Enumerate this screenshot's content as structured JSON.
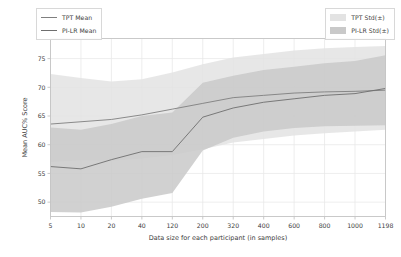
{
  "chart_data": {
    "type": "line",
    "title": "",
    "xlabel": "Data size for each participant (in samples)",
    "ylabel": "Mean AUC% Score",
    "x_tick_labels": [
      "5",
      "10",
      "20",
      "40",
      "120",
      "200",
      "320",
      "400",
      "600",
      "800",
      "1000",
      "1198"
    ],
    "x_positions": [
      0,
      1,
      2,
      3,
      4,
      5,
      6,
      7,
      8,
      9,
      10,
      11
    ],
    "y_tick_labels": [
      "50",
      "55",
      "60",
      "65",
      "70",
      "75"
    ],
    "ylim": [
      47.5,
      78.5
    ],
    "grid": true,
    "legend_position": "top-left and top-right (outside axes, overlapping)",
    "series": [
      {
        "name": "TPT Mean",
        "type": "line",
        "color": "#7f7f7f",
        "values": [
          63.6,
          64.0,
          64.4,
          65.2,
          66.2,
          67.2,
          68.2,
          68.6,
          69.0,
          69.2,
          69.3,
          69.5
        ],
        "band_name": "TPT Std(±)",
        "band_color": "#e3e3e3",
        "band_lower": [
          57.0,
          57.3,
          57.2,
          57.6,
          58.2,
          59.2,
          60.4,
          61.0,
          61.6,
          62.0,
          62.3,
          62.6
        ],
        "band_upper": [
          72.3,
          71.6,
          71.0,
          71.4,
          72.6,
          74.0,
          75.2,
          75.8,
          76.4,
          76.8,
          77.0,
          77.2
        ]
      },
      {
        "name": "PI-LR Mean",
        "type": "line",
        "color": "#6e6e6e",
        "values": [
          56.2,
          55.8,
          57.4,
          58.8,
          58.8,
          64.8,
          66.4,
          67.4,
          68.0,
          68.6,
          68.9,
          69.8
        ],
        "band_name": "PI-LR Std(±)",
        "band_color": "#c9c9c9",
        "band_lower": [
          48.3,
          48.2,
          49.2,
          50.6,
          51.6,
          59.0,
          61.2,
          62.3,
          62.9,
          63.2,
          63.3,
          63.4
        ],
        "band_upper": [
          63.0,
          62.6,
          63.6,
          65.0,
          65.6,
          70.8,
          72.0,
          73.0,
          73.6,
          74.2,
          74.6,
          75.6
        ]
      }
    ]
  },
  "legend_left": {
    "items": [
      {
        "label": "TPT Mean",
        "marker": "line-solid-gray"
      },
      {
        "label": "PI-LR Mean",
        "marker": "line-solid-dark-gray"
      }
    ]
  },
  "legend_right": {
    "items": [
      {
        "label": "TPT Std(±)",
        "marker": "swatch-light-gray"
      },
      {
        "label": "PI-LR Std(±)",
        "marker": "swatch-mid-gray"
      }
    ]
  },
  "colors": {
    "tpt_line": "#7f7f7f",
    "pilr_line": "#6e6e6e",
    "tpt_band": "#e3e3e3",
    "pilr_band": "#c9c9c9",
    "grid": "#e8e8e8",
    "axis": "#c4c4c4",
    "text": "#3d3d3d",
    "background": "#ffffff"
  }
}
